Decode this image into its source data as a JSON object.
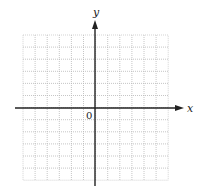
{
  "diagram": {
    "type": "coordinate-grid",
    "grid": {
      "columns": 12,
      "rows": 12,
      "left": 23,
      "top": 35,
      "cell_size": 12.1,
      "line_color": "#b8b8b8",
      "line_style": "dotted"
    },
    "axes": {
      "x_label": "x",
      "y_label": "y",
      "origin_label": "0",
      "axis_color": "#222222",
      "x_axis_y": 108,
      "y_axis_x": 95,
      "x_axis_start": 15,
      "x_axis_end": 184,
      "y_axis_top": 20,
      "y_axis_bottom": 186
    }
  }
}
